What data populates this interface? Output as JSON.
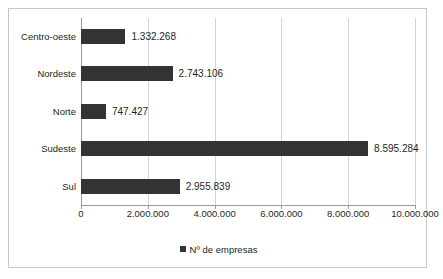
{
  "chart_data": {
    "type": "bar",
    "orientation": "horizontal",
    "title": "",
    "xlabel": "",
    "ylabel": "",
    "categories": [
      "Centro-oeste",
      "Nordeste",
      "Norte",
      "Sudeste",
      "Sul"
    ],
    "values": [
      1332268,
      2743106,
      747427,
      8595284,
      2955839
    ],
    "value_labels": [
      "1.332.268",
      "2.743.106",
      "747.427",
      "8.595.284",
      "2.955.839"
    ],
    "series": [
      {
        "name": "Nº de empresas",
        "color": "#333333",
        "values": [
          1332268,
          2743106,
          747427,
          8595284,
          2955839
        ]
      }
    ],
    "xlim": [
      0,
      10000000
    ],
    "xticks": [
      0,
      2000000,
      4000000,
      6000000,
      8000000,
      10000000
    ],
    "xtick_labels": [
      "0",
      "2.000.000",
      "4.000.000",
      "6.000.000",
      "8.000.000",
      "10.000.000"
    ],
    "grid": "vertical",
    "legend": {
      "position": "bottom-center",
      "entries": [
        {
          "label": "Nº de empresas",
          "color": "#333333",
          "marker": "square"
        }
      ]
    }
  }
}
